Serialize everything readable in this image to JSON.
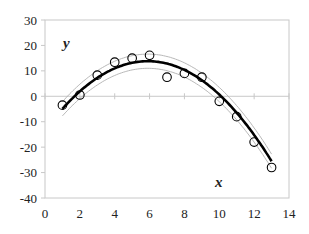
{
  "chart_data": {
    "type": "scatter",
    "title": "",
    "xlabel": "x",
    "ylabel": "y",
    "xlim": [
      0,
      14
    ],
    "ylim": [
      -40,
      30
    ],
    "xticks": [
      0,
      2,
      4,
      6,
      8,
      10,
      12,
      14
    ],
    "yticks": [
      30,
      20,
      10,
      0,
      -10,
      -20,
      -30,
      -40
    ],
    "grid": false,
    "legend": null,
    "series": [
      {
        "name": "observations",
        "style": "open-circle",
        "x": [
          1,
          2,
          3,
          4,
          5,
          6,
          7,
          8,
          9,
          10,
          11,
          12,
          13
        ],
        "y": [
          -3.5,
          0.5,
          8.3,
          13.4,
          15,
          16.1,
          7.5,
          9,
          7.5,
          -2,
          -8,
          -18,
          -28
        ]
      },
      {
        "name": "quadratic fit",
        "style": "thick-black-line",
        "equation": "y = -0.78 (x - 5.9)^2 + 13.8"
      },
      {
        "name": "upper band",
        "style": "thin-gray-line",
        "offset": 2.8
      },
      {
        "name": "lower band",
        "style": "thin-gray-line",
        "offset": -2.8
      }
    ]
  },
  "colors": {
    "axis": "#c8c8c8",
    "fit": "#000000",
    "band": "#b0b0b0",
    "marker": "#000000"
  }
}
